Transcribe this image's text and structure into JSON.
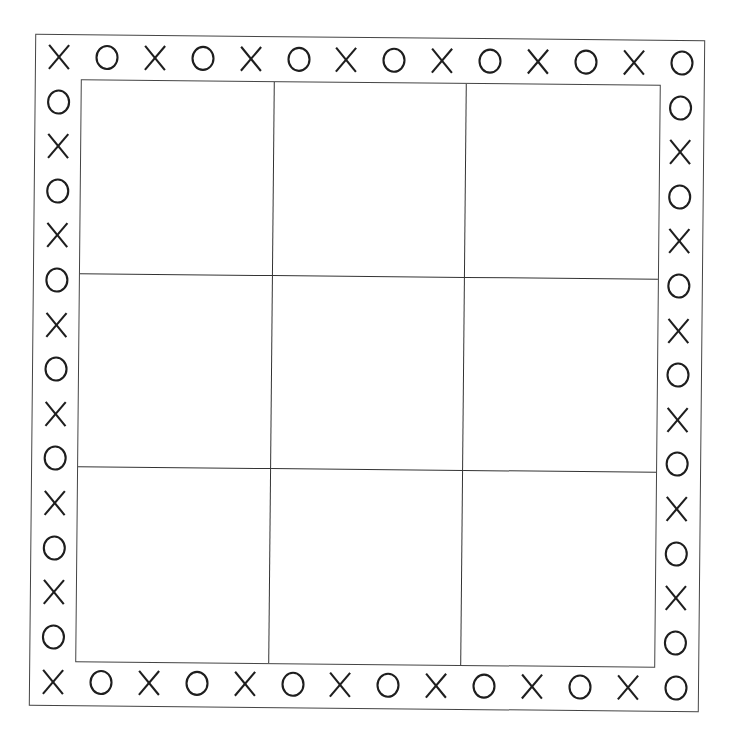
{
  "board": {
    "type": "tic-tac-toe",
    "rows": 3,
    "cols": 3,
    "cells": [
      [
        "",
        "",
        ""
      ],
      [
        "",
        "",
        ""
      ],
      [
        "",
        "",
        ""
      ]
    ],
    "line_color": "#333333",
    "symbol_color": "#1e1e1e"
  },
  "border": {
    "top": [
      "X",
      "O",
      "X",
      "O",
      "X",
      "O",
      "X",
      "O",
      "X",
      "O",
      "X",
      "O",
      "X",
      "O"
    ],
    "bottom": [
      "X",
      "O",
      "X",
      "O",
      "X",
      "O",
      "X",
      "O",
      "X",
      "O",
      "X",
      "O",
      "X",
      "O"
    ],
    "left": [
      "X",
      "O",
      "X",
      "O",
      "X",
      "O",
      "X",
      "O",
      "X",
      "O",
      "X",
      "O",
      "X",
      "O",
      "X"
    ],
    "right": [
      "O",
      "O",
      "X",
      "O",
      "X",
      "O",
      "X",
      "O",
      "X",
      "O",
      "X",
      "O",
      "X",
      "O",
      "O"
    ]
  }
}
